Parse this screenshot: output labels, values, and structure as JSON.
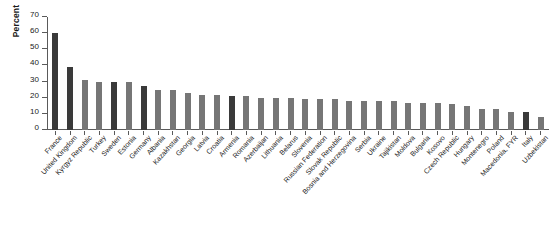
{
  "chart_data": {
    "type": "bar",
    "title": "",
    "xlabel": "",
    "ylabel": "Percent",
    "ylim": [
      0,
      70
    ],
    "yticks": [
      0,
      10,
      20,
      30,
      40,
      50,
      60,
      70
    ],
    "grid": false,
    "legend": null,
    "colors": {
      "dark": "#3a3a3a",
      "light": "#767676",
      "axis": "#5a5a5a",
      "text": "#1a1a1a",
      "background": "#ffffff"
    },
    "categories": [
      "France",
      "United Kingdom",
      "Kyrgyz Republic",
      "Turkey",
      "Sweden",
      "Estonia",
      "Germany",
      "Albania",
      "Kazakhstan",
      "Georgia",
      "Latvia",
      "Croatia",
      "Armenia",
      "Romania",
      "Azerbaijan",
      "Lithuania",
      "Belarus",
      "Slovenia",
      "Russian Federation",
      "Slovak Republic",
      "Bosnia and Herzegovina",
      "Serbia",
      "Ukraine",
      "Tajikistan",
      "Moldova",
      "Bulgaria",
      "Kosovo",
      "Czech Republic",
      "Hungary",
      "Montenegro",
      "Poland",
      "Macedonia, FYR",
      "Italy",
      "Uzbekistan"
    ],
    "values": [
      60,
      39,
      31,
      30,
      30,
      30,
      27,
      25,
      25,
      23,
      22,
      22,
      21,
      21,
      20,
      20,
      20,
      19,
      19,
      19,
      18,
      18,
      18,
      18,
      17,
      17,
      17,
      16,
      15,
      13,
      13,
      11,
      11,
      8
    ],
    "bar_shades": [
      "dark",
      "dark",
      "light",
      "light",
      "dark",
      "light",
      "dark",
      "light",
      "light",
      "light",
      "light",
      "light",
      "dark",
      "light",
      "light",
      "light",
      "light",
      "light",
      "light",
      "light",
      "light",
      "light",
      "light",
      "light",
      "light",
      "light",
      "light",
      "light",
      "light",
      "light",
      "light",
      "light",
      "dark",
      "light"
    ]
  }
}
